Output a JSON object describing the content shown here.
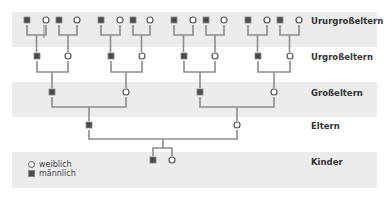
{
  "generations": [
    {
      "label": "Ururgroßeltern",
      "band": "gray"
    },
    {
      "label": "Urgroßeltern",
      "band": "white"
    },
    {
      "label": "Großeltern",
      "band": "gray"
    },
    {
      "label": "Eltern",
      "band": "white"
    },
    {
      "label": "Kinder",
      "band": "gray"
    }
  ],
  "legend": {
    "female_label": "weiblich",
    "male_label": "männlich"
  },
  "colors": {
    "band_gray": "#ececec",
    "line": "#8c8c8c",
    "male_fill": "#4a4a4a",
    "female_stroke": "#555555",
    "label_text": "#333333"
  }
}
